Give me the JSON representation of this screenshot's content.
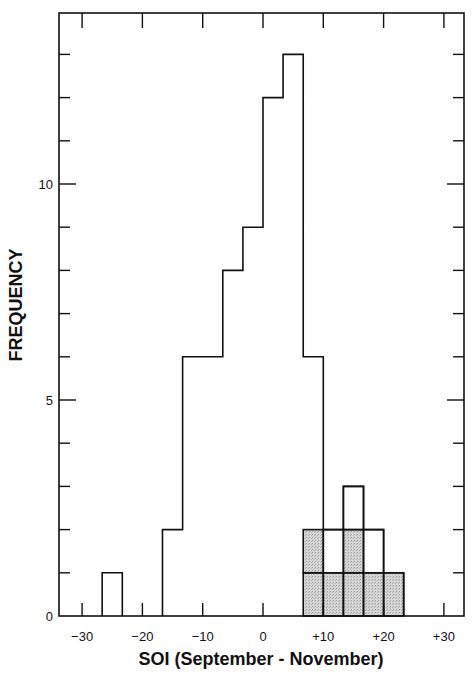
{
  "chart_data": {
    "type": "bar",
    "subtype": "histogram",
    "title": "",
    "xlabel": "SOI (September - November)",
    "ylabel": "FREQUENCY",
    "xlim": [
      -34,
      33.5
    ],
    "ylim": [
      0,
      13.9
    ],
    "x_ticks": [
      -30,
      -20,
      -10,
      0,
      10,
      20,
      30
    ],
    "x_tick_labels": [
      "−30",
      "−20",
      "−10",
      "0",
      "+10",
      "+20",
      "+30"
    ],
    "y_ticks": [
      0,
      1,
      2,
      3,
      4,
      5,
      6,
      7,
      8,
      9,
      10,
      11,
      12,
      13
    ],
    "y_tick_labels": {
      "0": "0",
      "5": "5",
      "10": "10"
    },
    "grid": false,
    "legend": null,
    "bin_width": 3.33,
    "bin_edges": [
      -26.67,
      -23.33,
      -20.0,
      -16.67,
      -13.33,
      -10.0,
      -6.67,
      -3.33,
      0.0,
      3.33,
      6.67,
      10.0,
      13.33,
      16.67,
      20.0,
      23.33
    ],
    "series": [
      {
        "name": "All years",
        "style": "outline",
        "color": "#111111",
        "values": [
          1,
          0,
          0,
          2,
          6,
          6,
          8,
          9,
          12,
          13,
          6,
          2,
          3,
          2,
          1
        ]
      },
      {
        "name": "Highlighted years",
        "style": "shaded",
        "color": "#c8c8c8",
        "values": [
          0,
          0,
          0,
          0,
          0,
          0,
          0,
          0,
          0,
          0,
          2,
          1,
          2,
          1,
          1
        ]
      }
    ]
  },
  "colors": {
    "axis": "#111111",
    "shade": "#cfcfcf",
    "background": "#ffffff"
  }
}
